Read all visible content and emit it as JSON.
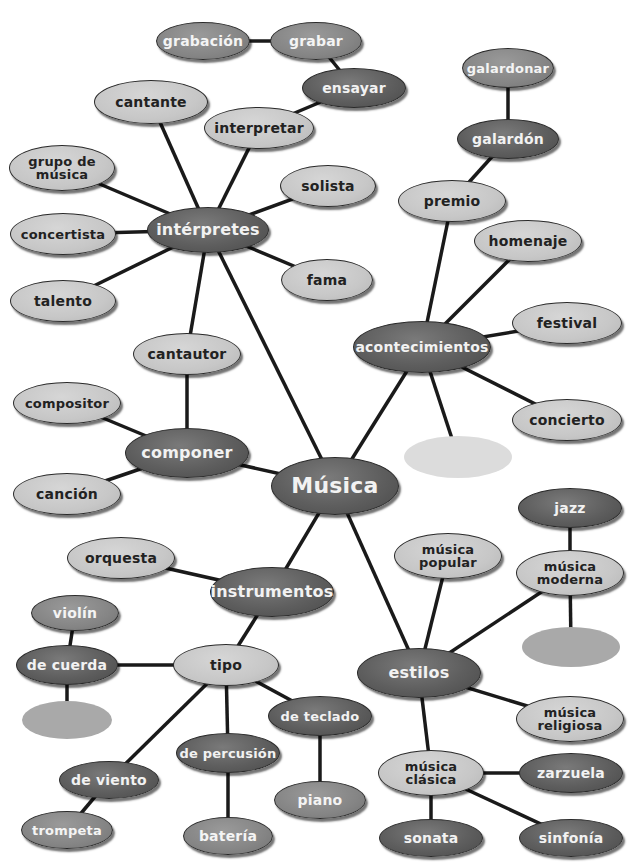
{
  "diagram": {
    "type": "concept-map",
    "title": "Música",
    "colors": {
      "dark": "#5e5e5e",
      "medium": "#858585",
      "light": "#c7c7c7",
      "blank_light": "#dcdcdc",
      "blank_medium": "#a9a9a9",
      "edge": "#1a1a1a",
      "background": "#ffffff"
    },
    "nodes": [
      {
        "id": "musica",
        "label": "Música",
        "x": 335,
        "y": 486,
        "w": 128,
        "h": 58,
        "shade": "dark",
        "size": "xl"
      },
      {
        "id": "interpretes",
        "label": "intérpretes",
        "x": 208,
        "y": 230,
        "w": 122,
        "h": 46,
        "shade": "dark",
        "size": "l"
      },
      {
        "id": "grabacion",
        "label": "grabación",
        "x": 203,
        "y": 41,
        "w": 94,
        "h": 38,
        "shade": "medium",
        "size": "m"
      },
      {
        "id": "grabar",
        "label": "grabar",
        "x": 316,
        "y": 41,
        "w": 92,
        "h": 38,
        "shade": "medium",
        "size": "m"
      },
      {
        "id": "ensayar",
        "label": "ensayar",
        "x": 354,
        "y": 88,
        "w": 104,
        "h": 40,
        "shade": "dark",
        "size": "m"
      },
      {
        "id": "cantante",
        "label": "cantante",
        "x": 151,
        "y": 102,
        "w": 114,
        "h": 44,
        "shade": "light",
        "size": "m"
      },
      {
        "id": "interpretar",
        "label": "interpretar",
        "x": 259,
        "y": 128,
        "w": 110,
        "h": 42,
        "shade": "light",
        "size": "m"
      },
      {
        "id": "grupo_musica",
        "label": "grupo de\nmúsica",
        "x": 62,
        "y": 168,
        "w": 106,
        "h": 46,
        "shade": "light",
        "size": "s"
      },
      {
        "id": "solista",
        "label": "solista",
        "x": 328,
        "y": 186,
        "w": 96,
        "h": 42,
        "shade": "light",
        "size": "m"
      },
      {
        "id": "concertista",
        "label": "concertista",
        "x": 63,
        "y": 234,
        "w": 106,
        "h": 42,
        "shade": "light",
        "size": "s"
      },
      {
        "id": "fama",
        "label": "fama",
        "x": 327,
        "y": 280,
        "w": 92,
        "h": 42,
        "shade": "light",
        "size": "m"
      },
      {
        "id": "talento",
        "label": "talento",
        "x": 63,
        "y": 301,
        "w": 106,
        "h": 42,
        "shade": "light",
        "size": "m"
      },
      {
        "id": "galardonar",
        "label": "galardonar",
        "x": 508,
        "y": 68,
        "w": 92,
        "h": 40,
        "shade": "medium",
        "size": "s"
      },
      {
        "id": "galardon",
        "label": "galardón",
        "x": 508,
        "y": 139,
        "w": 102,
        "h": 40,
        "shade": "dark",
        "size": "m"
      },
      {
        "id": "premio",
        "label": "premio",
        "x": 452,
        "y": 201,
        "w": 108,
        "h": 42,
        "shade": "light",
        "size": "m"
      },
      {
        "id": "homenaje",
        "label": "homenaje",
        "x": 528,
        "y": 241,
        "w": 108,
        "h": 42,
        "shade": "light",
        "size": "m"
      },
      {
        "id": "acontecimientos",
        "label": "acontecimientos",
        "x": 422,
        "y": 347,
        "w": 138,
        "h": 52,
        "shade": "dark",
        "size": "m"
      },
      {
        "id": "festival",
        "label": "festival",
        "x": 567,
        "y": 323,
        "w": 110,
        "h": 42,
        "shade": "light",
        "size": "m"
      },
      {
        "id": "concierto",
        "label": "concierto",
        "x": 567,
        "y": 420,
        "w": 110,
        "h": 42,
        "shade": "light",
        "size": "m"
      },
      {
        "id": "blank_acont",
        "label": "",
        "x": 458,
        "y": 457,
        "w": 108,
        "h": 42,
        "shade": "blank-light",
        "size": "m"
      },
      {
        "id": "cantautor",
        "label": "cantautor",
        "x": 187,
        "y": 354,
        "w": 108,
        "h": 42,
        "shade": "light",
        "size": "m"
      },
      {
        "id": "compositor",
        "label": "compositor",
        "x": 67,
        "y": 403,
        "w": 108,
        "h": 42,
        "shade": "light",
        "size": "s"
      },
      {
        "id": "componer",
        "label": "componer",
        "x": 187,
        "y": 453,
        "w": 124,
        "h": 50,
        "shade": "dark",
        "size": "l"
      },
      {
        "id": "cancion",
        "label": "canción",
        "x": 67,
        "y": 494,
        "w": 108,
        "h": 42,
        "shade": "light",
        "size": "m"
      },
      {
        "id": "orquesta",
        "label": "orquesta",
        "x": 121,
        "y": 558,
        "w": 108,
        "h": 42,
        "shade": "light",
        "size": "m"
      },
      {
        "id": "instrumentos",
        "label": "instrumentos",
        "x": 272,
        "y": 592,
        "w": 124,
        "h": 50,
        "shade": "dark",
        "size": "l"
      },
      {
        "id": "violin",
        "label": "violín",
        "x": 75,
        "y": 613,
        "w": 88,
        "h": 36,
        "shade": "medium",
        "size": "m"
      },
      {
        "id": "de_cuerda",
        "label": "de cuerda",
        "x": 67,
        "y": 665,
        "w": 102,
        "h": 40,
        "shade": "dark",
        "size": "m"
      },
      {
        "id": "tipo",
        "label": "tipo",
        "x": 226,
        "y": 665,
        "w": 106,
        "h": 42,
        "shade": "light",
        "size": "m"
      },
      {
        "id": "blank_cuerda",
        "label": "",
        "x": 67,
        "y": 720,
        "w": 90,
        "h": 38,
        "shade": "blank-medium",
        "size": "m"
      },
      {
        "id": "de_teclado",
        "label": "de teclado",
        "x": 320,
        "y": 716,
        "w": 104,
        "h": 40,
        "shade": "dark",
        "size": "s"
      },
      {
        "id": "de_percusion",
        "label": "de percusión",
        "x": 228,
        "y": 753,
        "w": 104,
        "h": 40,
        "shade": "dark",
        "size": "s"
      },
      {
        "id": "de_viento",
        "label": "de viento",
        "x": 109,
        "y": 780,
        "w": 100,
        "h": 38,
        "shade": "dark",
        "size": "m"
      },
      {
        "id": "trompeta",
        "label": "trompeta",
        "x": 67,
        "y": 830,
        "w": 92,
        "h": 38,
        "shade": "medium",
        "size": "s"
      },
      {
        "id": "bateria",
        "label": "batería",
        "x": 228,
        "y": 836,
        "w": 90,
        "h": 38,
        "shade": "medium",
        "size": "m"
      },
      {
        "id": "piano",
        "label": "piano",
        "x": 320,
        "y": 800,
        "w": 92,
        "h": 38,
        "shade": "medium",
        "size": "m"
      },
      {
        "id": "jazz",
        "label": "jazz",
        "x": 570,
        "y": 508,
        "w": 104,
        "h": 40,
        "shade": "dark",
        "size": "m"
      },
      {
        "id": "musica_popular",
        "label": "música\npopular",
        "x": 448,
        "y": 556,
        "w": 108,
        "h": 46,
        "shade": "light",
        "size": "s"
      },
      {
        "id": "musica_moderna",
        "label": "música\nmoderna",
        "x": 570,
        "y": 573,
        "w": 108,
        "h": 46,
        "shade": "light",
        "size": "s"
      },
      {
        "id": "blank_moderna",
        "label": "",
        "x": 571,
        "y": 647,
        "w": 98,
        "h": 40,
        "shade": "blank-medium",
        "size": "m"
      },
      {
        "id": "estilos",
        "label": "estilos",
        "x": 419,
        "y": 673,
        "w": 124,
        "h": 50,
        "shade": "dark",
        "size": "l"
      },
      {
        "id": "musica_religiosa",
        "label": "música\nreligiosa",
        "x": 570,
        "y": 719,
        "w": 108,
        "h": 46,
        "shade": "light",
        "size": "s"
      },
      {
        "id": "musica_clasica",
        "label": "música\nclásica",
        "x": 431,
        "y": 773,
        "w": 106,
        "h": 46,
        "shade": "light",
        "size": "s"
      },
      {
        "id": "zarzuela",
        "label": "zarzuela",
        "x": 571,
        "y": 773,
        "w": 104,
        "h": 40,
        "shade": "dark",
        "size": "m"
      },
      {
        "id": "sonata",
        "label": "sonata",
        "x": 431,
        "y": 838,
        "w": 104,
        "h": 38,
        "shade": "dark",
        "size": "m"
      },
      {
        "id": "sinfonia",
        "label": "sinfonía",
        "x": 571,
        "y": 838,
        "w": 104,
        "h": 38,
        "shade": "dark",
        "size": "m"
      }
    ],
    "edges": [
      [
        "musica",
        "interpretes"
      ],
      [
        "musica",
        "acontecimientos"
      ],
      [
        "musica",
        "componer"
      ],
      [
        "musica",
        "instrumentos"
      ],
      [
        "musica",
        "estilos"
      ],
      [
        "grabacion",
        "grabar"
      ],
      [
        "grabar",
        "ensayar"
      ],
      [
        "ensayar",
        "interpretar"
      ],
      [
        "interpretes",
        "interpretar"
      ],
      [
        "interpretes",
        "cantante"
      ],
      [
        "interpretes",
        "grupo_musica"
      ],
      [
        "interpretes",
        "solista"
      ],
      [
        "interpretes",
        "concertista"
      ],
      [
        "interpretes",
        "fama"
      ],
      [
        "interpretes",
        "talento"
      ],
      [
        "interpretes",
        "cantautor"
      ],
      [
        "galardonar",
        "galardon"
      ],
      [
        "galardon",
        "premio"
      ],
      [
        "premio",
        "acontecimientos"
      ],
      [
        "homenaje",
        "acontecimientos"
      ],
      [
        "acontecimientos",
        "festival"
      ],
      [
        "acontecimientos",
        "concierto"
      ],
      [
        "acontecimientos",
        "blank_acont"
      ],
      [
        "cantautor",
        "componer"
      ],
      [
        "compositor",
        "componer"
      ],
      [
        "cancion",
        "componer"
      ],
      [
        "orquesta",
        "instrumentos"
      ],
      [
        "instrumentos",
        "tipo"
      ],
      [
        "violin",
        "de_cuerda"
      ],
      [
        "de_cuerda",
        "tipo"
      ],
      [
        "de_cuerda",
        "blank_cuerda"
      ],
      [
        "tipo",
        "de_teclado"
      ],
      [
        "tipo",
        "de_percusion"
      ],
      [
        "tipo",
        "de_viento"
      ],
      [
        "de_viento",
        "trompeta"
      ],
      [
        "de_percusion",
        "bateria"
      ],
      [
        "de_teclado",
        "piano"
      ],
      [
        "jazz",
        "musica_moderna"
      ],
      [
        "musica_moderna",
        "blank_moderna"
      ],
      [
        "musica_moderna",
        "estilos"
      ],
      [
        "musica_popular",
        "estilos"
      ],
      [
        "estilos",
        "musica_religiosa"
      ],
      [
        "estilos",
        "musica_clasica"
      ],
      [
        "musica_clasica",
        "zarzuela"
      ],
      [
        "musica_clasica",
        "sonata"
      ],
      [
        "musica_clasica",
        "sinfonia"
      ]
    ]
  }
}
